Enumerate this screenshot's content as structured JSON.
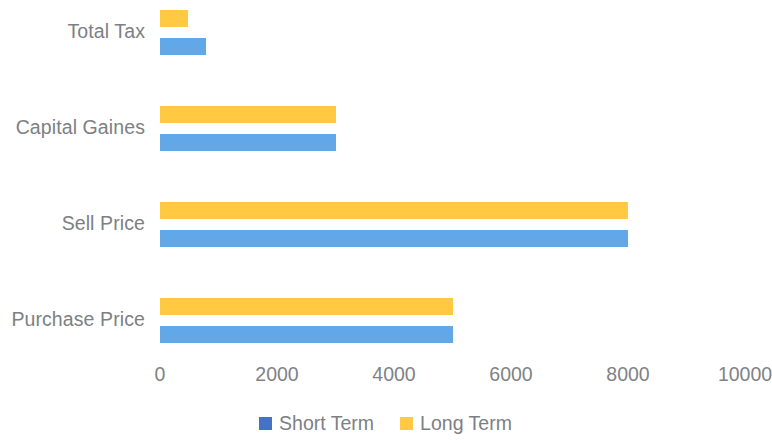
{
  "chart_data": {
    "type": "bar",
    "orientation": "horizontal",
    "title": "",
    "xlabel": "",
    "ylabel": "",
    "categories": [
      "Total Tax",
      "Capital Gaines",
      "Sell Price",
      "Purchase Price"
    ],
    "series": [
      {
        "name": "Short Term",
        "color": "#62a8e8",
        "legend_color": "#4472c4",
        "values": [
          790,
          3000,
          8000,
          5000
        ]
      },
      {
        "name": "Long Term",
        "color": "#ffc942",
        "legend_color": "#ffc942",
        "values": [
          480,
          3000,
          8000,
          5000
        ]
      }
    ],
    "series_draw_order": [
      "Long Term",
      "Short Term"
    ],
    "xticks": [
      0,
      2000,
      4000,
      6000,
      8000,
      10000
    ],
    "xtick_labels": [
      "0",
      "2000",
      "4000",
      "6000",
      "8000",
      "10000"
    ],
    "xlim": [
      0,
      10000
    ],
    "grid": false,
    "axis_line": false,
    "legend_position": "bottom",
    "legend_entries": [
      {
        "label": "Short Term",
        "color": "#4472c4"
      },
      {
        "label": "Long Term",
        "color": "#ffc942"
      }
    ]
  },
  "colors": {
    "background": "#ffffff",
    "text": "#808285",
    "bar_long_term": "#ffc942",
    "bar_short_term": "#62a8e8",
    "legend_short_term": "#4472c4"
  }
}
